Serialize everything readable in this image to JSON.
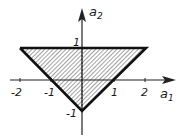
{
  "diagram": {
    "title": "",
    "axes": {
      "x": {
        "label": "a",
        "subscript": "1",
        "ticks": [
          "-2",
          "-1",
          "1",
          "2"
        ],
        "tick_values": [
          -2,
          -1,
          1,
          2
        ]
      },
      "y": {
        "label": "a",
        "subscript": "2",
        "ticks": [
          "1",
          "-1"
        ],
        "tick_values": [
          1,
          -1
        ]
      }
    },
    "region": {
      "shape": "triangle",
      "vertices": [
        [
          -2,
          1
        ],
        [
          2,
          1
        ],
        [
          0,
          -1
        ]
      ],
      "fill": "hatched",
      "edges": [
        "a2 = 1",
        "a2 = a1 - 1",
        "a2 = -a1 - 1"
      ]
    },
    "colors": {
      "ink": "#1a1a1a",
      "hatch": "#555555",
      "background": "#ffffff"
    }
  }
}
